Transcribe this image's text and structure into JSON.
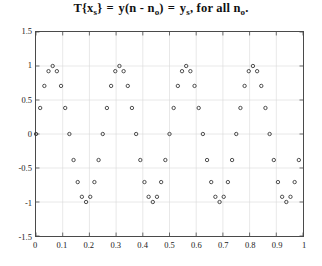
{
  "title": {
    "t_op": "T",
    "x_var": "x",
    "x_sub": "s",
    "y_func": "y",
    "n_var": "n",
    "n_var2": "n",
    "n_sub": "o",
    "y_var": "y",
    "y_sub": "s",
    "tail": ", for all",
    "n_var3": "n",
    "n_sub2": "o",
    "period": ".",
    "plain": "T{xs} = y(n - no) = ys, for all no."
  },
  "axes": {
    "x_ticks": [
      "0",
      "0.1",
      "0.2",
      "0.3",
      "0.4",
      "0.5",
      "0.6",
      "0.7",
      "0.8",
      "0.9",
      "1"
    ],
    "x_tick_values": [
      0,
      0.1,
      0.2,
      0.3,
      0.4,
      0.5,
      0.6,
      0.7,
      0.8,
      0.9,
      1
    ],
    "y_ticks": [
      "1.5",
      "1",
      "0.5",
      "0",
      "-0.5",
      "-1",
      "-1.5"
    ],
    "y_tick_values": [
      1.5,
      1,
      0.5,
      0,
      -0.5,
      -1,
      -1.5
    ],
    "xlim": [
      0,
      1
    ],
    "ylim": [
      -1.5,
      1.5
    ],
    "grid": true,
    "grid_color": "#d8d8d8",
    "frame_color": "#4a4a4a"
  },
  "chart_data": {
    "type": "scatter",
    "title": "T{xs} = y(n - no) = ys, for all no.",
    "xlabel": "",
    "ylabel": "",
    "xlim": [
      0,
      1
    ],
    "ylim": [
      -1.5,
      1.5
    ],
    "grid": true,
    "legend": null,
    "marker": {
      "shape": "circle-open",
      "radius": 1.7,
      "color": "#3a3a3a",
      "fill": "none",
      "stroke_width": 0.9
    },
    "series": [
      {
        "name": "y_s",
        "amplitude": 1.0,
        "cycles": 4,
        "phase": 0,
        "n_points": 64,
        "x": [
          0,
          0.015625,
          0.03125,
          0.046875,
          0.0625,
          0.078125,
          0.09375,
          0.109375,
          0.125,
          0.140625,
          0.15625,
          0.171875,
          0.1875,
          0.203125,
          0.21875,
          0.234375,
          0.25,
          0.265625,
          0.28125,
          0.296875,
          0.3125,
          0.328125,
          0.34375,
          0.359375,
          0.375,
          0.390625,
          0.40625,
          0.421875,
          0.4375,
          0.453125,
          0.46875,
          0.484375,
          0.5,
          0.515625,
          0.53125,
          0.546875,
          0.5625,
          0.578125,
          0.59375,
          0.609375,
          0.625,
          0.640625,
          0.65625,
          0.671875,
          0.6875,
          0.703125,
          0.71875,
          0.734375,
          0.75,
          0.765625,
          0.78125,
          0.796875,
          0.8125,
          0.828125,
          0.84375,
          0.859375,
          0.875,
          0.890625,
          0.90625,
          0.921875,
          0.9375,
          0.953125,
          0.96875,
          0.984375
        ],
        "values": [
          0,
          0.3827,
          0.7071,
          0.9239,
          1,
          0.9239,
          0.7071,
          0.3827,
          0,
          -0.3827,
          -0.7071,
          -0.9239,
          -1,
          -0.9239,
          -0.7071,
          -0.3827,
          0,
          0.3827,
          0.7071,
          0.9239,
          1,
          0.9239,
          0.7071,
          0.3827,
          0,
          -0.3827,
          -0.7071,
          -0.9239,
          -1,
          -0.9239,
          -0.7071,
          -0.3827,
          0,
          0.3827,
          0.7071,
          0.9239,
          1,
          0.9239,
          0.7071,
          0.3827,
          0,
          -0.3827,
          -0.7071,
          -0.9239,
          -1,
          -0.9239,
          -0.7071,
          -0.3827,
          0,
          0.3827,
          0.7071,
          0.9239,
          1,
          0.9239,
          0.7071,
          0.3827,
          0,
          -0.3827,
          -0.7071,
          -0.9239,
          -1,
          -0.9239,
          -0.7071,
          -0.3827
        ]
      }
    ]
  }
}
